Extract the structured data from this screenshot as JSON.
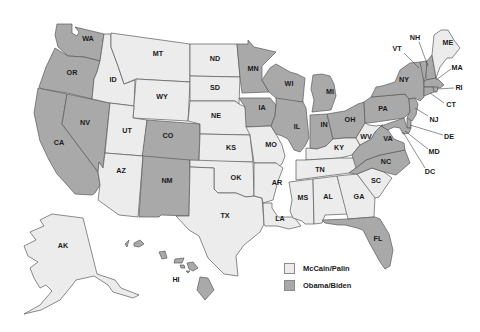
{
  "colors": {
    "mccain": "#ececec",
    "obama": "#a9a9a9",
    "background": "#ffffff"
  },
  "legend": {
    "items": [
      {
        "label": "McCain/Palin",
        "party": "mccain"
      },
      {
        "label": "Obama/Biden",
        "party": "obama"
      }
    ]
  },
  "states": [
    {
      "abbr": "WA",
      "winner": "obama",
      "lx": 88,
      "ly": 39,
      "pts": "57,24 72,24 72,33 77,36 79,32 75,27 100,33 104,34 100,61 84,57 68,56 58,47 55,35"
    },
    {
      "abbr": "OR",
      "winner": "obama",
      "lx": 72,
      "ly": 73,
      "pts": "55,48 68,56 84,57 100,61 97,72 94,79 92,99 67,93 42,89 39,87 46,67"
    },
    {
      "abbr": "CA",
      "winner": "obama",
      "lx": 59,
      "ly": 143,
      "pts": "38,88 67,94 62,124 98,172 100,185 95,193 92,195 75,194 68,186 57,174 49,160 40,141 34,113"
    },
    {
      "abbr": "NV",
      "winner": "obama",
      "lx": 85,
      "ly": 123,
      "pts": "67,94 110,103 103,168 99,162 98,172 62,124"
    },
    {
      "abbr": "ID",
      "winner": "mccain",
      "lx": 113,
      "ly": 80,
      "pts": "104,34 111,34 111,47 118,66 122,78 124,84 135,80 134,106 110,103 92,99 94,79 97,72 100,61"
    },
    {
      "abbr": "MT",
      "winner": "mccain",
      "lx": 158,
      "ly": 54,
      "pts": "111,33 190,44 190,82 136,79 124,84 122,78 118,66 111,47"
    },
    {
      "abbr": "WY",
      "winner": "mccain",
      "lx": 162,
      "ly": 97,
      "pts": "136,79 190,82 188,121 133,118"
    },
    {
      "abbr": "UT",
      "winner": "mccain",
      "lx": 127,
      "ly": 131,
      "pts": "110,103 134,106 133,118 147,120 143,156 105,153"
    },
    {
      "abbr": "CO",
      "winner": "obama",
      "lx": 168,
      "ly": 136,
      "pts": "147,120 200,124 199,162 142,158"
    },
    {
      "abbr": "AZ",
      "winner": "mccain",
      "lx": 121,
      "ly": 171,
      "pts": "105,153 143,156 138,217 119,215 98,200 100,185 98,172 99,162 103,168"
    },
    {
      "abbr": "NM",
      "winner": "obama",
      "lx": 167,
      "ly": 181,
      "pts": "143,156 190,160 189,216 161,215 159,217 139,217"
    },
    {
      "abbr": "ND",
      "winner": "mccain",
      "lx": 215,
      "ly": 59,
      "pts": "190,44 237,44 240,77 190,76"
    },
    {
      "abbr": "SD",
      "winner": "mccain",
      "lx": 215,
      "ly": 88,
      "pts": "190,76 240,77 239,104 235,101 190,101"
    },
    {
      "abbr": "NE",
      "winner": "mccain",
      "lx": 216,
      "ly": 116,
      "pts": "190,101 235,101 239,104 245,107 250,135 200,134 200,124 188,121"
    },
    {
      "abbr": "KS",
      "winner": "mccain",
      "lx": 231,
      "ly": 148,
      "pts": "200,134 250,135 253,162 199,162"
    },
    {
      "abbr": "OK",
      "winner": "mccain",
      "lx": 236,
      "ly": 178,
      "pts": "190,160 253,162 254,196 246,197 236,193 218,193 214,189 214,168 190,167"
    },
    {
      "abbr": "TX",
      "winner": "mccain",
      "lx": 225,
      "ly": 216,
      "pts": "190,167 214,168 214,189 218,193 236,193 246,197 254,196 262,198 264,224 260,232 244,245 236,256 238,276 224,274 208,258 199,236 189,230 176,216 189,216"
    },
    {
      "abbr": "MN",
      "winner": "obama",
      "lx": 253,
      "ly": 69,
      "pts": "237,44 248,44 248,40 254,47 276,52 262,66 262,80 269,92 242,93 240,77"
    },
    {
      "abbr": "IA",
      "winner": "obama",
      "lx": 262,
      "ly": 108,
      "pts": "239,98 270,98 276,105 275,116 271,126 246,127 245,107"
    },
    {
      "abbr": "MO",
      "winner": "mccain",
      "lx": 271,
      "ly": 145,
      "pts": "246,127 271,126 276,134 282,145 285,156 282,164 276,168 276,163 254,163 250,135"
    },
    {
      "abbr": "AR",
      "winner": "mccain",
      "lx": 277,
      "ly": 183,
      "pts": "254,163 276,163 283,168 278,181 273,200 263,203 262,198 254,196"
    },
    {
      "abbr": "LA",
      "winner": "mccain",
      "lx": 280,
      "ly": 219,
      "pts": "263,203 272,203 272,208 278,217 294,217 301,226 289,229 277,226 265,226 264,224"
    },
    {
      "abbr": "WI",
      "winner": "obama",
      "lx": 289,
      "ly": 84,
      "pts": "270,68 276,64 290,72 297,74 305,78 303,99 303,102 281,101 276,98 269,92 262,80"
    },
    {
      "abbr": "IL",
      "winner": "obama",
      "lx": 297,
      "ly": 127,
      "pts": "276,98 303,102 306,108 309,138 305,146 300,152 294,150 288,139 282,136 276,134 271,126 275,116 276,105"
    },
    {
      "abbr": "MI",
      "winner": "obama",
      "lx": 330,
      "ly": 92,
      "pts": "313,75 322,74 330,76 334,84 336,96 331,110 312,112 314,100 311,89"
    },
    {
      "abbr": "IN",
      "winner": "obama",
      "lx": 324,
      "ly": 125,
      "pts": "310,115 327,114 333,139 326,146 317,149 310,148"
    },
    {
      "abbr": "OH",
      "winner": "obama",
      "lx": 350,
      "ly": 120,
      "pts": "327,114 345,111 358,104 364,102 365,123 356,138 345,138 333,139"
    },
    {
      "abbr": "KY",
      "winner": "mccain",
      "lx": 339,
      "ly": 148,
      "pts": "306,148 317,149 326,146 333,139 345,138 356,138 360,145 352,155 340,158 306,160"
    },
    {
      "abbr": "TN",
      "winner": "mccain",
      "lx": 320,
      "ly": 170,
      "pts": "296,160 306,160 340,158 360,158 366,160 356,168 349,173 296,180"
    },
    {
      "abbr": "MS",
      "winner": "mccain",
      "lx": 303,
      "ly": 198,
      "pts": "289,182 313,179 314,224 305,224 302,221 293,218 290,211 292,200"
    },
    {
      "abbr": "AL",
      "winner": "mccain",
      "lx": 328,
      "ly": 197,
      "pts": "313,179 337,176 348,214 325,215 322,223 314,224"
    },
    {
      "abbr": "GA",
      "winner": "mccain",
      "lx": 359,
      "ly": 197,
      "pts": "337,176 357,174 375,197 374,217 348,219"
    },
    {
      "abbr": "FL",
      "winner": "obama",
      "lx": 378,
      "ly": 239,
      "pts": "322,220 348,219 374,217 375,217 380,219 389,234 393,250 390,266 385,269 380,262 370,244 363,230 357,228 345,225 338,225 325,223"
    },
    {
      "abbr": "SC",
      "winner": "mccain",
      "lx": 376,
      "ly": 181,
      "pts": "357,174 372,168 384,172 392,178 379,197 375,198"
    },
    {
      "abbr": "NC",
      "winner": "obama",
      "lx": 386,
      "ly": 162,
      "pts": "349,173 356,168 366,160 380,155 405,150 410,163 396,175 384,172 372,168 357,174"
    },
    {
      "abbr": "VA",
      "winner": "obama",
      "lx": 388,
      "ly": 139,
      "pts": "356,168 352,155 360,145 371,139 375,132 381,126 388,130 394,139 404,143 405,150 380,155 366,160"
    },
    {
      "abbr": "WV",
      "winner": "mccain",
      "lx": 366,
      "ly": 137,
      "pts": "356,138 365,123 369,125 376,126 383,125 381,126 375,132 371,139 360,145"
    },
    {
      "abbr": "PA",
      "winner": "obama",
      "lx": 383,
      "ly": 109,
      "pts": "364,102 371,97 405,94 409,99 410,112 404,118 369,123 365,123"
    },
    {
      "abbr": "NY",
      "winner": "obama",
      "lx": 404,
      "ly": 80,
      "pts": "371,97 376,87 382,86 395,82 400,70 410,63 420,62 423,72 424,87 424,97 420,101 415,98 409,99 405,94"
    },
    {
      "abbr": "VT",
      "winner": "obama",
      "lx": 0,
      "ly": 0,
      "pts": "420,62 427,61 426,76 424,82"
    },
    {
      "abbr": "NH",
      "winner": "obama",
      "lx": 0,
      "ly": 0,
      "pts": "427,61 432,55 435,72 436,78 426,80 426,76"
    },
    {
      "abbr": "ME",
      "winner": "mccain",
      "lx": 448,
      "ly": 43,
      "pts": "432,55 434,35 441,30 448,30 454,40 460,48 452,58 447,58 440,67 436,78 435,72"
    },
    {
      "abbr": "MA",
      "winner": "obama",
      "lx": 0,
      "ly": 0,
      "pts": "424,82 426,80 436,78 440,81 444,85 440,88 433,87 424,87"
    },
    {
      "abbr": "RI",
      "winner": "obama",
      "lx": 0,
      "ly": 0,
      "pts": "433,87 438,87 437,92 434,92"
    },
    {
      "abbr": "CT",
      "winner": "obama",
      "lx": 0,
      "ly": 0,
      "pts": "424,87 433,87 434,92 424,96"
    },
    {
      "abbr": "NJ",
      "winner": "obama",
      "lx": 0,
      "ly": 0,
      "pts": "409,99 415,98 418,104 416,115 412,121 407,117 410,112"
    },
    {
      "abbr": "DE",
      "winner": "obama",
      "lx": 0,
      "ly": 0,
      "pts": "407,118 411,121 411,128 407,128"
    },
    {
      "abbr": "MD",
      "winner": "obama",
      "lx": 0,
      "ly": 0,
      "pts": "381,126 404,118 407,128 411,128 409,133 403,134 400,128 394,127 388,130"
    },
    {
      "abbr": "AK",
      "winner": "mccain",
      "lx": 63,
      "ly": 246,
      "pts": "40,220 52,214 83,218 97,274 115,280 121,288 139,295 133,298 113,292 108,285 94,276 76,280 70,288 60,300 41,310 24,314 40,305 52,291 46,285 40,288 34,278 30,268 38,262 28,256 24,246 36,240 30,232 44,226"
    }
  ],
  "hawaii": {
    "label": "HI",
    "winner": "obama",
    "lx": 176,
    "ly": 280,
    "islands": [
      "125,244 129,240 127,247",
      "134,243 140,240 144,244 139,247 134,246",
      "159,252 165,251 167,258 162,259",
      "175,259 184,258 182,263 174,263",
      "180,265 184,265 185,268 181,268",
      "187,263 193,262 198,268 193,271 189,269",
      "186,271 190,271 188,273",
      "200,277 208,278 214,290 205,300 197,290"
    ]
  },
  "callouts": [
    {
      "abbr": "VT",
      "lx": 397,
      "ly": 49,
      "line": "404,53 419,68"
    },
    {
      "abbr": "NH",
      "lx": 415,
      "ly": 38,
      "line": "419,42 428,66"
    },
    {
      "abbr": "MA",
      "lx": 457,
      "ly": 68,
      "line": "451,69 436,80"
    },
    {
      "abbr": "RI",
      "lx": 459,
      "ly": 88,
      "line": "454,88 437,89"
    },
    {
      "abbr": "CT",
      "lx": 451,
      "ly": 105,
      "line": "444,103 430,93"
    },
    {
      "abbr": "NJ",
      "lx": 434,
      "ly": 120,
      "line": "428,116 415,108"
    },
    {
      "abbr": "DE",
      "lx": 449,
      "ly": 137,
      "line": "443,135 410,125"
    },
    {
      "abbr": "MD",
      "lx": 434,
      "ly": 152,
      "line": "428,149 405,131"
    },
    {
      "abbr": "DC",
      "lx": 430,
      "ly": 172,
      "line": "425,168 403,132"
    }
  ]
}
